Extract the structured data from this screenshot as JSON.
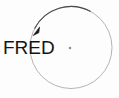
{
  "canvas": {
    "width": 119,
    "height": 98,
    "background_color": "#fdfdfd"
  },
  "diagram": {
    "label": "FRED",
    "label_color": "#141414",
    "circle": {
      "name": "orbit-circle",
      "center_x": 71,
      "center_y": 47.5,
      "radius": 41,
      "stroke_color": "#b4b4b4",
      "stroke_width": 1,
      "fill": "none"
    },
    "center_dot": {
      "name": "center-point",
      "x": 70,
      "y": 48,
      "radius": 1.3,
      "color": "#8e8e8e"
    },
    "direction_arrow": {
      "name": "counterclockwise-arrow",
      "stroke_color": "#4a4a4a",
      "stroke_width": 1.1,
      "arrowhead_color": "#1a1a1a",
      "sweep": "counterclockwise",
      "start_angle_deg": -62,
      "end_angle_deg": -152,
      "tip_x": 33.5,
      "tip_y": 34.5
    }
  }
}
